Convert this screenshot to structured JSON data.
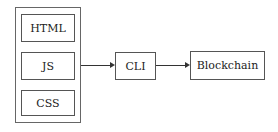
{
  "diagram": {
    "group": {
      "items": [
        {
          "label": "HTML"
        },
        {
          "label": "JS"
        },
        {
          "label": "CSS"
        }
      ]
    },
    "nodes": {
      "cli": {
        "label": "CLI"
      },
      "blockchain": {
        "label": "Blockchain"
      }
    },
    "edges": [
      {
        "from": "frontend-group",
        "to": "CLI"
      },
      {
        "from": "CLI",
        "to": "Blockchain"
      }
    ]
  }
}
